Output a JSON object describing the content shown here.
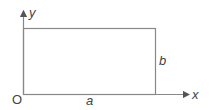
{
  "diagram": {
    "origin_label": "O",
    "x_axis_label": "x",
    "y_axis_label": "y",
    "width_label": "a",
    "height_label": "b",
    "colors": {
      "stroke": "#888888",
      "text": "#444444"
    }
  }
}
